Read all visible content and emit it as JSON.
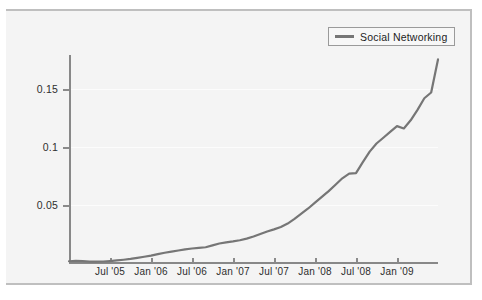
{
  "figure": {
    "background": "#f4f4f4",
    "frame_color": "#bfbfbf",
    "line_color": "#767676",
    "text_color": "#2e2e2e"
  },
  "legend": {
    "position": "top-right",
    "entries": [
      {
        "label": "Social Networking",
        "color": "#767676"
      }
    ]
  },
  "chart_data": {
    "type": "line",
    "title": "",
    "xlabel": "",
    "ylabel": "Percentage of Matching Job Postings",
    "legend_position": "top-right",
    "grid": true,
    "xlim": [
      "Jan '05",
      "Jul '09"
    ],
    "ylim": [
      0,
      0.18
    ],
    "ytick_labels": [
      "0.05",
      "0.1",
      "0.15"
    ],
    "ytick_values": [
      0.05,
      0.1,
      0.15
    ],
    "xtick_labels": [
      "Jul '05",
      "Jan '06",
      "Jul '06",
      "Jan '07",
      "Jul '07",
      "Jan '08",
      "Jul '08",
      "Jan '09"
    ],
    "series": [
      {
        "name": "Social Networking",
        "color": "#767676",
        "x": [
          "Jan '05",
          "Feb '05",
          "Mar '05",
          "Apr '05",
          "May '05",
          "Jun '05",
          "Jul '05",
          "Aug '05",
          "Sep '05",
          "Oct '05",
          "Nov '05",
          "Dec '05",
          "Jan '06",
          "Feb '06",
          "Mar '06",
          "Apr '06",
          "May '06",
          "Jun '06",
          "Jul '06",
          "Aug '06",
          "Sep '06",
          "Oct '06",
          "Nov '06",
          "Dec '06",
          "Jan '07",
          "Feb '07",
          "Mar '07",
          "Apr '07",
          "May '07",
          "Jun '07",
          "Jul '07",
          "Aug '07",
          "Sep '07",
          "Oct '07",
          "Nov '07",
          "Dec '07",
          "Jan '08",
          "Feb '08",
          "Mar '08",
          "Apr '08",
          "May '08",
          "Jun '08",
          "Jul '08",
          "Aug '08",
          "Sep '08",
          "Oct '08",
          "Nov '08",
          "Dec '08",
          "Jan '09",
          "Feb '09",
          "Mar '09",
          "Apr '09",
          "May '09",
          "Jun '09",
          "Jul '09"
        ],
        "values": [
          0.0015,
          0.0018,
          0.0016,
          0.0012,
          0.0011,
          0.0013,
          0.0017,
          0.0022,
          0.0028,
          0.0035,
          0.0044,
          0.0054,
          0.0064,
          0.0076,
          0.0088,
          0.0098,
          0.0108,
          0.0118,
          0.0125,
          0.013,
          0.0136,
          0.0152,
          0.0168,
          0.0178,
          0.0186,
          0.0196,
          0.021,
          0.0228,
          0.025,
          0.0272,
          0.029,
          0.031,
          0.034,
          0.038,
          0.0425,
          0.047,
          0.052,
          0.057,
          0.062,
          0.0675,
          0.073,
          0.077,
          0.0775,
          0.087,
          0.096,
          0.103,
          0.108,
          0.113,
          0.118,
          0.116,
          0.123,
          0.132,
          0.142,
          0.147,
          0.1755
        ]
      }
    ],
    "annotations": []
  },
  "axes": {
    "y_title": "Percentage of Matching Job Postings"
  }
}
